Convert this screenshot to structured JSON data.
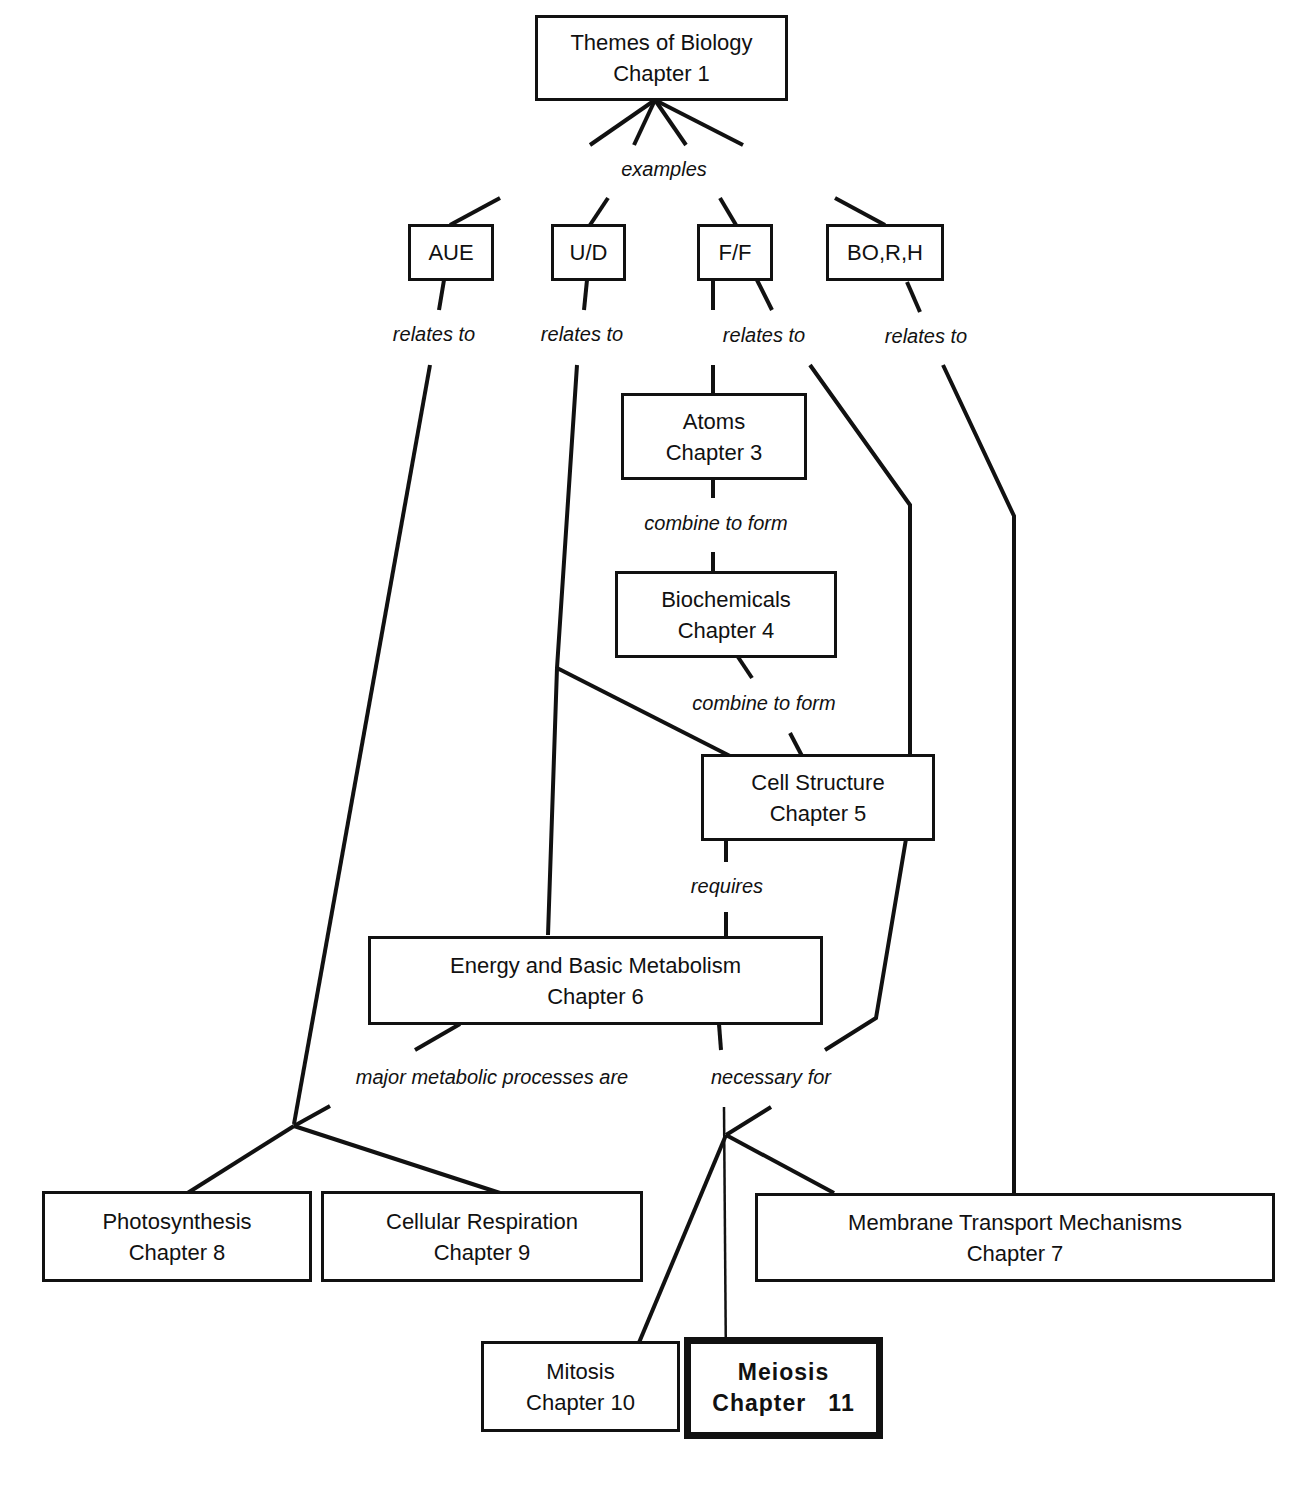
{
  "diagram": {
    "type": "concept-map",
    "nodes": [
      {
        "id": "themes",
        "title": "Themes of Biology",
        "subtitle": "Chapter 1"
      },
      {
        "id": "aue",
        "title": "AUE",
        "subtitle": ""
      },
      {
        "id": "ud",
        "title": "U/D",
        "subtitle": ""
      },
      {
        "id": "ff",
        "title": "F/F",
        "subtitle": ""
      },
      {
        "id": "borh",
        "title": "BO,R,H",
        "subtitle": ""
      },
      {
        "id": "atoms",
        "title": "Atoms",
        "subtitle": "Chapter 3"
      },
      {
        "id": "biochem",
        "title": "Biochemicals",
        "subtitle": "Chapter 4"
      },
      {
        "id": "cell",
        "title": "Cell Structure",
        "subtitle": "Chapter 5"
      },
      {
        "id": "energy",
        "title": "Energy and Basic Metabolism",
        "subtitle": "Chapter 6"
      },
      {
        "id": "photo",
        "title": "Photosynthesis",
        "subtitle": "Chapter 8"
      },
      {
        "id": "resp",
        "title": "Cellular Respiration",
        "subtitle": "Chapter 9"
      },
      {
        "id": "membrane",
        "title": "Membrane Transport Mechanisms",
        "subtitle": "Chapter 7"
      },
      {
        "id": "mitosis",
        "title": "Mitosis",
        "subtitle": "Chapter 10"
      },
      {
        "id": "meiosis",
        "title": "Meiosis",
        "subtitle": "Chapter   11",
        "highlighted": true
      }
    ],
    "link_labels": {
      "examples": "examples",
      "relates_aue": "relates to",
      "relates_ud": "relates to",
      "relates_ff": "relates to",
      "relates_borh": "relates to",
      "combine_1": "combine to form",
      "combine_2": "combine to form",
      "requires": "requires",
      "major": "major metabolic processes are",
      "necessary": "necessary for"
    },
    "edges": [
      {
        "from": "themes",
        "to": "aue",
        "label": "examples"
      },
      {
        "from": "themes",
        "to": "ud",
        "label": "examples"
      },
      {
        "from": "themes",
        "to": "ff",
        "label": "examples"
      },
      {
        "from": "themes",
        "to": "borh",
        "label": "examples"
      },
      {
        "from": "aue",
        "to": "photo",
        "label": "relates to"
      },
      {
        "from": "aue",
        "to": "resp",
        "label": "relates to"
      },
      {
        "from": "ud",
        "to": "cell",
        "label": "relates to"
      },
      {
        "from": "ud",
        "to": "energy",
        "label": "relates to"
      },
      {
        "from": "ff",
        "to": "atoms",
        "label": "relates to"
      },
      {
        "from": "ff",
        "to": "cell",
        "label": "relates to"
      },
      {
        "from": "borh",
        "to": "membrane",
        "label": "relates to"
      },
      {
        "from": "atoms",
        "to": "biochem",
        "label": "combine to form"
      },
      {
        "from": "biochem",
        "to": "cell",
        "label": "combine to form"
      },
      {
        "from": "cell",
        "to": "energy",
        "label": "requires"
      },
      {
        "from": "cell",
        "to": "mitosis",
        "label": "necessary for"
      },
      {
        "from": "energy",
        "to": "photo",
        "label": "major metabolic processes are"
      },
      {
        "from": "energy",
        "to": "resp",
        "label": "major metabolic processes are"
      },
      {
        "from": "energy",
        "to": "mitosis",
        "label": "necessary for"
      },
      {
        "from": "energy",
        "to": "meiosis",
        "label": "necessary for"
      },
      {
        "from": "energy",
        "to": "membrane",
        "label": "necessary for"
      }
    ]
  }
}
